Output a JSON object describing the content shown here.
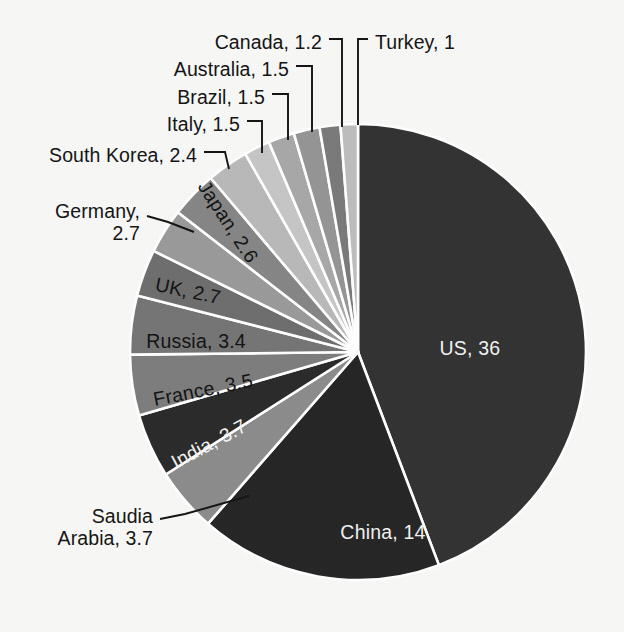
{
  "figure": {
    "title": "",
    "background_color": "#f8f8f6",
    "separator_color": "#ffffff"
  },
  "pie": {
    "center_x": 358,
    "center_y": 352,
    "radius": 228,
    "start_angle_deg": 0,
    "direction": "clockwise"
  },
  "chart_data": {
    "type": "pie",
    "title": "",
    "xlabel": "",
    "ylabel": "",
    "units": "",
    "total": 78.7,
    "legend": "none",
    "label_format": "name, value",
    "categories": [
      "US",
      "China",
      "Saudia Arabia",
      "India",
      "France",
      "Russia",
      "UK",
      "Japan",
      "Germany",
      "South Korea",
      "Italy",
      "Brazil",
      "Australia",
      "Canada",
      "Turkey"
    ],
    "values": [
      36,
      14,
      3.7,
      3.7,
      3.5,
      3.4,
      2.7,
      2.6,
      2.7,
      2.4,
      1.5,
      1.5,
      1.5,
      1.2,
      1
    ],
    "slices": [
      {
        "name": "US",
        "value": 36,
        "label": "US, 36",
        "color": "#333333",
        "label_placement": "inside",
        "label_color": "light",
        "label_x": 470,
        "label_y": 348,
        "label_rotation": 0
      },
      {
        "name": "China",
        "value": 14,
        "label": "China, 14",
        "color": "#262626",
        "label_placement": "inside",
        "label_color": "light",
        "label_x": 383,
        "label_y": 532,
        "label_rotation": 0
      },
      {
        "name": "Saudia Arabia",
        "value": 3.7,
        "label": "Saudia\nArabia, 3.7",
        "color": "#8c8c8c",
        "label_placement": "callout",
        "label_color": "dark",
        "label_x": 153,
        "label_y": 527,
        "leader": [
          [
            160,
            519
          ],
          [
            185,
            514
          ],
          [
            249,
            496
          ]
        ]
      },
      {
        "name": "India",
        "value": 3.7,
        "label": "India, 3.7",
        "color": "#2b2b2b",
        "label_placement": "inside",
        "label_color": "light",
        "label_x": 209,
        "label_y": 444,
        "label_rotation": -28
      },
      {
        "name": "France",
        "value": 3.5,
        "label": "France, 3.5",
        "color": "#7d7d7d",
        "label_placement": "inside",
        "label_color": "dark",
        "label_x": 203,
        "label_y": 390,
        "label_rotation": -11
      },
      {
        "name": "Russia",
        "value": 3.4,
        "label": "Russia, 3.4",
        "color": "#757575",
        "label_placement": "inside",
        "label_color": "dark",
        "label_x": 196,
        "label_y": 341,
        "label_rotation": 0
      },
      {
        "name": "UK",
        "value": 2.7,
        "label": "UK, 2.7",
        "color": "#6e6e6e",
        "label_placement": "inside",
        "label_color": "dark",
        "label_x": 188,
        "label_y": 291,
        "label_rotation": 12
      },
      {
        "name": "Japan",
        "value": 2.6,
        "label": "Japan, 2.6",
        "color": "#9a9a9a",
        "label_placement": "inside",
        "label_color": "dark",
        "label_x": 228,
        "label_y": 222,
        "label_rotation": 57
      },
      {
        "name": "Germany",
        "value": 2.7,
        "label": "Germany,\n2.7",
        "color": "#868686",
        "label_placement": "callout",
        "label_color": "dark",
        "label_x": 140,
        "label_y": 222,
        "leader": [
          [
            147,
            216
          ],
          [
            168,
            222
          ],
          [
            194,
            232
          ]
        ]
      },
      {
        "name": "South Korea",
        "value": 2.4,
        "label": "South Korea, 2.4",
        "color": "#b9b9b9",
        "label_placement": "callout",
        "label_color": "dark",
        "label_x": 197,
        "label_y": 155,
        "leader": [
          [
            204,
            152
          ],
          [
            225,
            152
          ],
          [
            229,
            169
          ]
        ]
      },
      {
        "name": "Italy",
        "value": 1.5,
        "label": "Italy, 1.5",
        "color": "#c6c6c6",
        "label_placement": "callout",
        "label_color": "dark",
        "label_x": 240,
        "label_y": 124,
        "leader": [
          [
            247,
            121
          ],
          [
            262,
            121
          ],
          [
            262,
            153
          ]
        ]
      },
      {
        "name": "Brazil",
        "value": 1.5,
        "label": "Brazil, 1.5",
        "color": "#a8a8a8",
        "label_placement": "callout",
        "label_color": "dark",
        "label_x": 265,
        "label_y": 97,
        "leader": [
          [
            272,
            94
          ],
          [
            288,
            94
          ],
          [
            288,
            140
          ]
        ]
      },
      {
        "name": "Australia",
        "value": 1.5,
        "label": "Australia, 1.5",
        "color": "#959595",
        "label_placement": "callout",
        "label_color": "dark",
        "label_x": 289,
        "label_y": 69,
        "leader": [
          [
            296,
            66
          ],
          [
            312,
            66
          ],
          [
            312,
            132
          ]
        ]
      },
      {
        "name": "Canada",
        "value": 1.2,
        "label": "Canada, 1.2",
        "color": "#7a7a7a",
        "label_placement": "callout",
        "label_color": "dark",
        "label_x": 322,
        "label_y": 42,
        "leader": [
          [
            329,
            39
          ],
          [
            342,
            39
          ],
          [
            342,
            127
          ]
        ]
      },
      {
        "name": "Turkey",
        "value": 1,
        "label": "Turkey, 1",
        "color": "#bdbdbd",
        "label_placement": "callout",
        "label_color": "dark",
        "label_x": 375,
        "label_y": 42,
        "leader": [
          [
            368,
            39
          ],
          [
            358,
            39
          ],
          [
            358,
            125
          ]
        ],
        "side": "right"
      }
    ]
  }
}
